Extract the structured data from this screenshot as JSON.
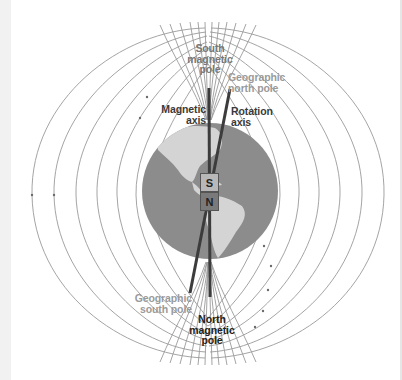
{
  "diagram": {
    "labels": {
      "south_magnetic_pole": [
        "South",
        "magnetic",
        "pole"
      ],
      "geographic_north_pole": [
        "Geographic",
        "north pole"
      ],
      "magnetic_axis": [
        "Magnetic",
        "axis"
      ],
      "rotation_axis": [
        "Rotation",
        "axis"
      ],
      "geographic_south_pole": [
        "Geographic",
        "south pole"
      ],
      "north_magnetic_pole": [
        "North",
        "magnetic",
        "pole"
      ]
    },
    "magnet": {
      "top_label": "S",
      "bottom_label": "N"
    },
    "colors": {
      "globe_ocean": "#8c8c8c",
      "globe_land": "#d4d4d4",
      "field_lines": "#9a9a9a",
      "axis_line": "#3c3c3c",
      "magnet_top": "#b8b8b8",
      "magnet_bottom": "#7a7a7a",
      "dark_label": "#3a3a3a",
      "gray_label": "#9a9a9a"
    }
  }
}
